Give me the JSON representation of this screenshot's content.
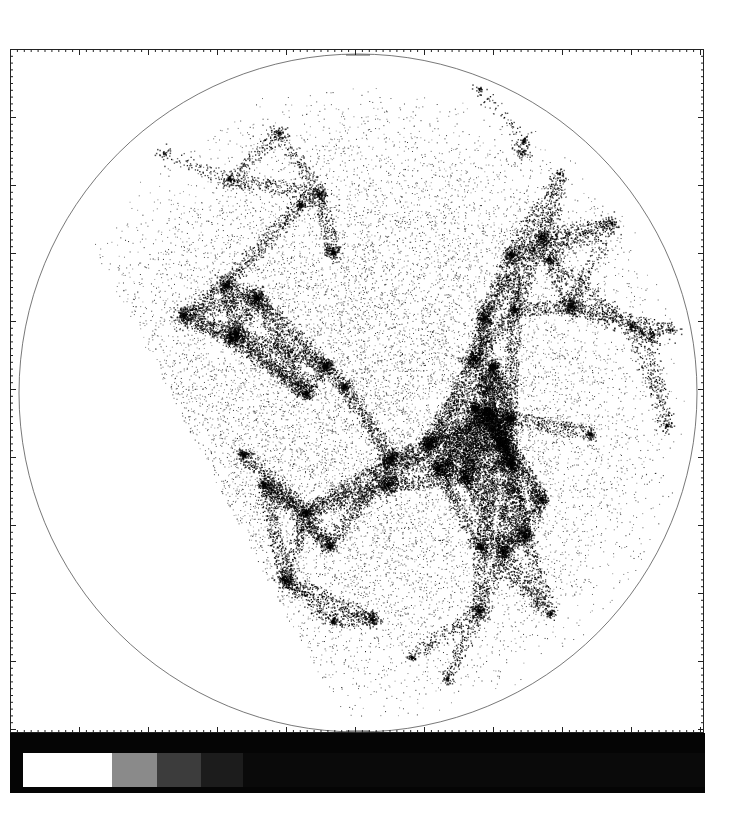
{
  "figure": {
    "caption_fragment": "",
    "type": "circular sky density map",
    "background": "#ffffff",
    "frame_color": "#222222",
    "circle": {
      "cx": 357,
      "cy": 392,
      "r": 339,
      "stroke": "#555555"
    },
    "empty_wedge": {
      "description": "unsurveyed region on lower-left side of the circle"
    },
    "density_color": "#000000"
  },
  "colorbar": {
    "background": "#050505",
    "segments": [
      {
        "color": "#ffffff",
        "width": 89
      },
      {
        "color": "#8a8a8a",
        "width": 45
      },
      {
        "color": "#3c3c3c",
        "width": 44
      },
      {
        "color": "#1c1c1c",
        "width": 42
      },
      {
        "color": "#0a0a0a",
        "width": 462
      }
    ]
  }
}
